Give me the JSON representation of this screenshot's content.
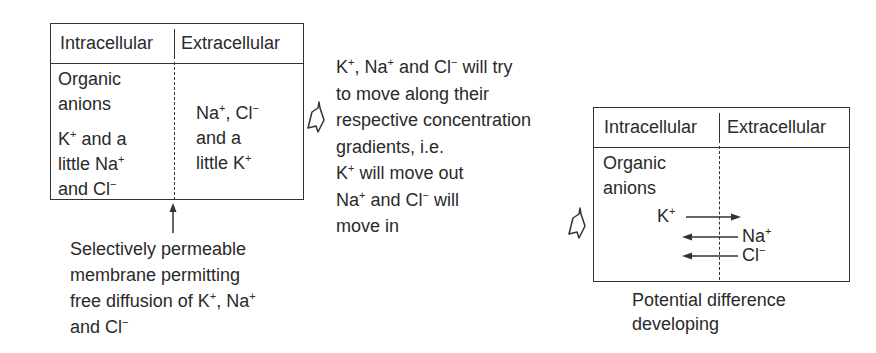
{
  "left_panel": {
    "header": {
      "intracellular": "Intracellular",
      "extracellular": "Extracellular"
    },
    "intracellular_lines": [
      "Organic",
      "anions"
    ],
    "intracellular_ions": [
      {
        "pre": "K",
        "sup": "+",
        "post": " and a"
      },
      {
        "pre": "little Na",
        "sup": "+",
        "post": ""
      },
      {
        "pre": "and Cl",
        "sup": "−",
        "post": ""
      }
    ],
    "extracellular_ions": [
      {
        "pre": "Na",
        "sup": "+",
        "mid": ", Cl",
        "sup2": "−"
      },
      {
        "pre": "and a",
        "sup": "",
        "mid": "",
        "sup2": ""
      },
      {
        "pre": "little K",
        "sup": "+",
        "mid": "",
        "sup2": ""
      }
    ],
    "membrane_caption": [
      {
        "text": "Selectively permeable"
      },
      {
        "text": "membrane permitting"
      },
      {
        "text": "free diffusion of K",
        "sup": "+",
        "text2": ", Na",
        "sup2": "+"
      },
      {
        "text": "and Cl",
        "sup": "−"
      }
    ]
  },
  "middle_text": [
    {
      "a": "K",
      "s1": "+",
      "b": ", Na",
      "s2": "+",
      "c": " and Cl",
      "s3": "−",
      "d": " will try"
    },
    {
      "a": "to move along their"
    },
    {
      "a": "respective concentration"
    },
    {
      "a": "gradients, i.e."
    },
    {
      "a": "K",
      "s1": "+",
      "b": " will move out"
    },
    {
      "a": "Na",
      "s1": "+",
      "b": " and Cl",
      "s2": "−",
      "c": " will"
    },
    {
      "a": "move in"
    }
  ],
  "right_panel": {
    "header": {
      "intracellular": "Intracellular",
      "extracellular": "Extracellular"
    },
    "intracellular_lines": [
      "Organic",
      "anions"
    ],
    "flows": [
      {
        "ion": "K",
        "sup": "+",
        "direction": "out"
      },
      {
        "ion": "Na",
        "sup": "+",
        "direction": "in"
      },
      {
        "ion": "Cl",
        "sup": "−",
        "direction": "in"
      }
    ],
    "caption": [
      "Potential difference",
      "developing"
    ]
  }
}
